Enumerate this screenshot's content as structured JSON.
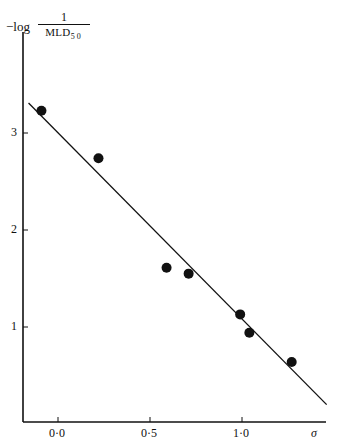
{
  "chart_data": {
    "type": "scatter",
    "title": "",
    "xlabel": "σ",
    "ylabel": "−log 1/MLD50",
    "ylabel_parts": {
      "prefix": "−log",
      "numerator": "1",
      "denominator": "MLD",
      "subscript": "50"
    },
    "x_ticks": [
      {
        "value": 0.0,
        "label": "0·0"
      },
      {
        "value": 0.5,
        "label": "0·5"
      },
      {
        "value": 1.0,
        "label": "1·0"
      }
    ],
    "y_ticks": [
      {
        "value": 1,
        "label": "1"
      },
      {
        "value": 2,
        "label": "2"
      },
      {
        "value": 3,
        "label": "3"
      }
    ],
    "xlim": [
      -0.2,
      1.47
    ],
    "ylim": [
      0,
      3.9
    ],
    "grid": false,
    "legend": null,
    "points": [
      {
        "x": -0.09,
        "y": 3.23
      },
      {
        "x": 0.22,
        "y": 2.74
      },
      {
        "x": 0.59,
        "y": 1.61
      },
      {
        "x": 0.71,
        "y": 1.55
      },
      {
        "x": 0.99,
        "y": 1.13
      },
      {
        "x": 1.04,
        "y": 0.94
      },
      {
        "x": 1.27,
        "y": 0.64
      }
    ],
    "fit_line": {
      "x1": -0.16,
      "y1": 3.31,
      "x2": 1.46,
      "y2": 0.2
    }
  },
  "pixel_map": {
    "x0": 58,
    "px_per_x": 184,
    "y1px": 327,
    "px_per_y": 97,
    "axis_x": 23,
    "axis_y": 422,
    "axis_right": 326,
    "axis_top": 32
  }
}
